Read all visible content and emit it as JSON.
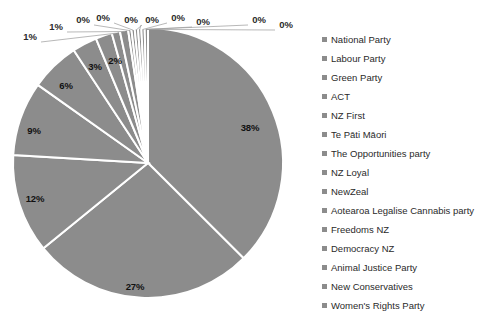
{
  "chart_data": {
    "type": "pie",
    "title": "",
    "legend_position": "right",
    "categories": [
      "National Party",
      "Labour Party",
      "Green Party",
      "ACT",
      "NZ First",
      "Te Pāti Māori",
      "The Opportunities party",
      "NZ Loyal",
      "NewZeal",
      "Aotearoa Legalise Cannabis party",
      "Freedoms NZ",
      "Democracy NZ",
      "Animal Justice Party",
      "New Conservatives",
      "Women's Rights Party"
    ],
    "values": [
      38,
      27,
      12,
      9,
      6,
      3,
      2,
      1,
      1,
      0,
      0,
      0,
      0,
      0,
      0
    ],
    "data_labels": [
      "38%",
      "27%",
      "12%",
      "9%",
      "6%",
      "3%",
      "2%",
      "1%",
      "1%",
      "0%",
      "0%",
      "0%",
      "0%",
      "0%",
      "0%"
    ],
    "slice_color": "#8c8c8c",
    "separator_color": "#ffffff",
    "label_color": "#1a1a1a",
    "background": "#ffffff"
  },
  "legend": {
    "items": [
      {
        "label": "National Party",
        "color": "#8c8c8c"
      },
      {
        "label": "Labour Party",
        "color": "#8c8c8c"
      },
      {
        "label": "Green Party",
        "color": "#8c8c8c"
      },
      {
        "label": "ACT",
        "color": "#8c8c8c"
      },
      {
        "label": "NZ First",
        "color": "#8c8c8c"
      },
      {
        "label": "Te Pāti Māori",
        "color": "#8c8c8c"
      },
      {
        "label": "The Opportunities party",
        "color": "#8c8c8c"
      },
      {
        "label": "NZ Loyal",
        "color": "#8c8c8c"
      },
      {
        "label": "NewZeal",
        "color": "#8c8c8c"
      },
      {
        "label": "Aotearoa Legalise Cannabis party",
        "color": "#8c8c8c"
      },
      {
        "label": "Freedoms NZ",
        "color": "#8c8c8c"
      },
      {
        "label": "Democracy NZ",
        "color": "#8c8c8c"
      },
      {
        "label": "Animal Justice Party",
        "color": "#8c8c8c"
      },
      {
        "label": "New Conservatives",
        "color": "#8c8c8c"
      },
      {
        "label": "Women's Rights Party",
        "color": "#8c8c8c"
      }
    ]
  },
  "labels": {
    "inside": [
      {
        "text": "38%",
        "x": 250,
        "y": 127
      },
      {
        "text": "27%",
        "x": 135,
        "y": 286
      },
      {
        "text": "12%",
        "x": 35,
        "y": 198
      },
      {
        "text": "9%",
        "x": 34,
        "y": 130
      },
      {
        "text": "6%",
        "x": 66,
        "y": 85
      },
      {
        "text": "3%",
        "x": 95,
        "y": 66
      },
      {
        "text": "2%",
        "x": 115,
        "y": 60
      }
    ],
    "outside": [
      {
        "text": "1%",
        "x": 30,
        "y": 36
      },
      {
        "text": "1%",
        "x": 56,
        "y": 26
      },
      {
        "text": "0%",
        "x": 83,
        "y": 19
      },
      {
        "text": "0%",
        "x": 103,
        "y": 17
      },
      {
        "text": "0%",
        "x": 131,
        "y": 19
      },
      {
        "text": "0%",
        "x": 152,
        "y": 19
      },
      {
        "text": "0%",
        "x": 178,
        "y": 17
      },
      {
        "text": "0%",
        "x": 203,
        "y": 21
      },
      {
        "text": "0%",
        "x": 259,
        "y": 19
      },
      {
        "text": "0%",
        "x": 286,
        "y": 24
      }
    ]
  }
}
